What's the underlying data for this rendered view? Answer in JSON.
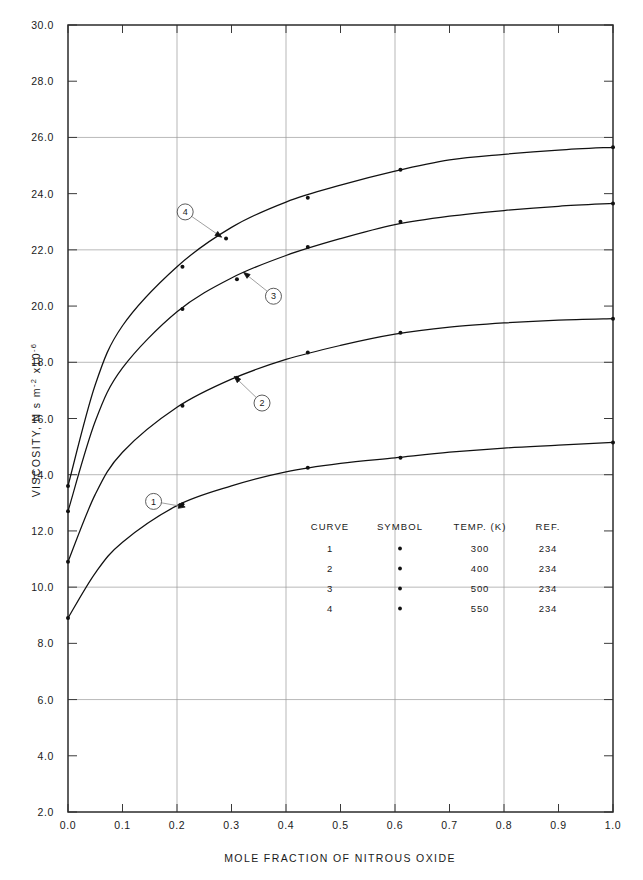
{
  "chart_data": {
    "type": "line",
    "title": "",
    "xlabel": "MOLE FRACTION OF NITROUS OXIDE",
    "ylabel": "VISCOSITY, N s m⁻² x10⁻⁶",
    "ylabel_parts": {
      "prefix": "VISCOSITY, N s m",
      "exp1": "-2",
      "mid": "x10",
      "exp2": "-6"
    },
    "xlim": [
      0.0,
      1.0
    ],
    "ylim": [
      2.0,
      30.0
    ],
    "xticks": [
      0.0,
      0.1,
      0.2,
      0.3,
      0.4,
      0.5,
      0.6,
      0.7,
      0.8,
      0.9,
      1.0
    ],
    "xticklabels": [
      "0.0",
      "0.1",
      "0.2",
      "0.3",
      "0.4",
      "0.5",
      "0.6",
      "0.7",
      "0.8",
      "0.9",
      "1.0"
    ],
    "yticks": [
      2.0,
      4.0,
      6.0,
      8.0,
      10.0,
      12.0,
      14.0,
      16.0,
      18.0,
      20.0,
      22.0,
      24.0,
      26.0,
      28.0,
      30.0
    ],
    "yticklabels": [
      "2.0",
      "4.0",
      "6.0",
      "8.0",
      "10.0",
      "12.0",
      "14.0",
      "16.0",
      "18.0",
      "20.0",
      "22.0",
      "24.0",
      "26.0",
      "28.0",
      "30.0"
    ],
    "xgridlines": [
      0.2,
      0.4,
      0.6,
      0.8
    ],
    "ygridlines": [
      6.0,
      10.0,
      14.0,
      18.0,
      22.0,
      26.0
    ],
    "grid": true,
    "legend_position": "inside-lower-center",
    "series": [
      {
        "name": "1",
        "curve": "1",
        "temp_k": "300",
        "ref": "234",
        "symbol": "•",
        "x": [
          0.0,
          0.05,
          0.1,
          0.2,
          0.3,
          0.4,
          0.5,
          0.6,
          0.7,
          0.8,
          0.9,
          1.0
        ],
        "y": [
          8.9,
          10.5,
          11.6,
          12.9,
          13.6,
          14.1,
          14.4,
          14.6,
          14.8,
          14.95,
          15.05,
          15.15
        ],
        "markers_x": [
          0.0,
          0.21,
          0.44,
          0.61,
          1.0
        ],
        "markers_y": [
          8.9,
          12.95,
          14.25,
          14.6,
          15.15
        ]
      },
      {
        "name": "2",
        "curve": "2",
        "temp_k": "400",
        "ref": "234",
        "symbol": "•",
        "x": [
          0.0,
          0.05,
          0.1,
          0.2,
          0.3,
          0.4,
          0.5,
          0.6,
          0.7,
          0.8,
          0.9,
          1.0
        ],
        "y": [
          10.9,
          13.3,
          14.8,
          16.4,
          17.4,
          18.1,
          18.6,
          19.0,
          19.25,
          19.4,
          19.5,
          19.55
        ],
        "markers_x": [
          0.0,
          0.21,
          0.31,
          0.44,
          0.61,
          1.0
        ],
        "markers_y": [
          10.9,
          16.45,
          17.45,
          18.35,
          19.05,
          19.55
        ]
      },
      {
        "name": "3",
        "curve": "3",
        "temp_k": "500",
        "ref": "234",
        "symbol": "•",
        "x": [
          0.0,
          0.05,
          0.1,
          0.2,
          0.3,
          0.4,
          0.5,
          0.6,
          0.7,
          0.8,
          0.9,
          1.0
        ],
        "y": [
          12.7,
          15.9,
          17.8,
          19.8,
          21.0,
          21.8,
          22.4,
          22.9,
          23.2,
          23.4,
          23.55,
          23.65
        ],
        "markers_x": [
          0.0,
          0.21,
          0.31,
          0.44,
          0.61,
          1.0
        ],
        "markers_y": [
          12.7,
          19.9,
          20.95,
          22.1,
          23.0,
          23.65
        ]
      },
      {
        "name": "4",
        "curve": "4",
        "temp_k": "550",
        "ref": "234",
        "symbol": "•",
        "x": [
          0.0,
          0.05,
          0.1,
          0.2,
          0.3,
          0.4,
          0.5,
          0.6,
          0.7,
          0.8,
          0.9,
          1.0
        ],
        "y": [
          13.6,
          17.2,
          19.3,
          21.4,
          22.8,
          23.7,
          24.3,
          24.8,
          25.2,
          25.4,
          25.55,
          25.65
        ],
        "markers_x": [
          0.0,
          0.21,
          0.29,
          0.44,
          0.61,
          1.0
        ],
        "markers_y": [
          13.6,
          21.4,
          22.4,
          23.85,
          24.85,
          25.65
        ]
      }
    ],
    "callouts": [
      {
        "label": "1",
        "cx": 0.157,
        "cy": 13.05,
        "tipx": 0.215,
        "tipy": 12.85
      },
      {
        "label": "2",
        "cx": 0.356,
        "cy": 16.55,
        "tipx": 0.305,
        "tipy": 17.5
      },
      {
        "label": "3",
        "cx": 0.377,
        "cy": 20.35,
        "tipx": 0.322,
        "tipy": 21.2
      },
      {
        "label": "4",
        "cx": 0.215,
        "cy": 23.35,
        "tipx": 0.282,
        "tipy": 22.45
      }
    ]
  },
  "legend": {
    "headers": [
      "CURVE",
      "SYMBOL",
      "TEMP. (K)",
      "REF."
    ],
    "rows": [
      {
        "curve": "1",
        "symbol": "•",
        "temp": "300",
        "ref": "234"
      },
      {
        "curve": "2",
        "symbol": "•",
        "temp": "400",
        "ref": "234"
      },
      {
        "curve": "3",
        "symbol": "•",
        "temp": "500",
        "ref": "234"
      },
      {
        "curve": "4",
        "symbol": "•",
        "temp": "550",
        "ref": "234"
      }
    ]
  },
  "colors": {
    "curve": "#111111",
    "frame": "#2b2b2b",
    "grid": "#9a9a9a",
    "text": "#1a1a1a",
    "background": "#ffffff"
  }
}
